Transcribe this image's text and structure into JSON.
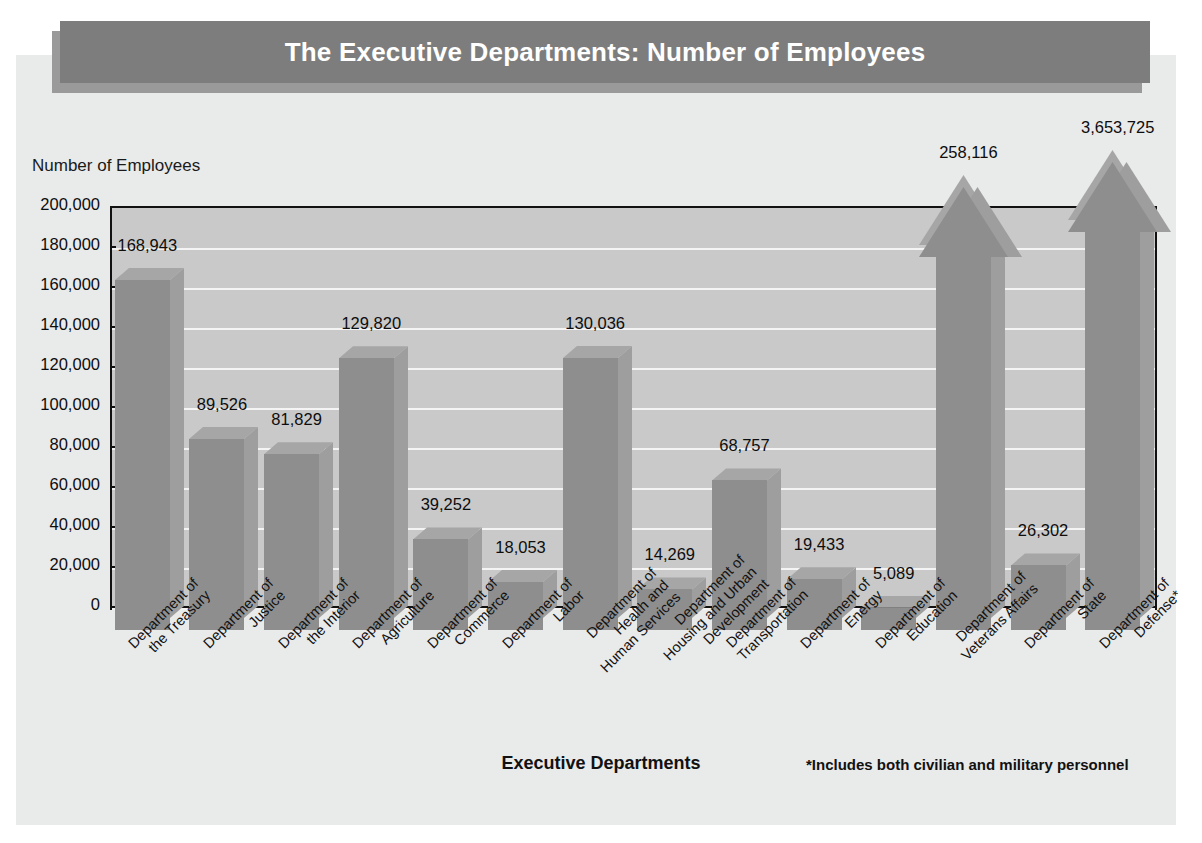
{
  "title": "The Executive Departments: Number of Employees",
  "axis": {
    "y_title": "Number of Employees",
    "x_title": "Executive Departments",
    "footnote": "*Includes both civilian and military personnel"
  },
  "chart_data": {
    "type": "bar",
    "title": "The Executive Departments: Number of Employees",
    "xlabel": "Executive Departments",
    "ylabel": "Number of Employees",
    "ylim": [
      0,
      200000
    ],
    "ytick_labels": [
      "200,000",
      "180,000",
      "160,000",
      "140,000",
      "120,000",
      "100,000",
      "80,000",
      "60,000",
      "40,000",
      "20,000",
      "0"
    ],
    "ytick_values": [
      200000,
      180000,
      160000,
      140000,
      120000,
      100000,
      80000,
      60000,
      40000,
      20000,
      0
    ],
    "grid": true,
    "legend": "none",
    "annotation": "*Includes both civilian and military personnel",
    "categories": [
      "Department of the Treasury",
      "Department of Justice",
      "Department of the Interior",
      "Department of Agriculture",
      "Department of Commerce",
      "Department of Labor",
      "Department of Health and Human Services",
      "Department of Housing and Urban Development",
      "Department of Transportation",
      "Department of Energy",
      "Department of Education",
      "Department of Veterans Affairs",
      "Department of State",
      "Department of Defense*"
    ],
    "values": [
      168943,
      89526,
      81829,
      129820,
      39252,
      18053,
      130036,
      14269,
      68757,
      19433,
      5089,
      258116,
      26302,
      3653725
    ],
    "value_labels": [
      "168,943",
      "89,526",
      "81,829",
      "129,820",
      "39,252",
      "18,053",
      "130,036",
      "14,269",
      "68,757",
      "19,433",
      "5,089",
      "258,116",
      "26,302",
      "3,653,725"
    ],
    "overflow_bars": [
      "Department of Veterans Affairs",
      "Department of Defense*"
    ]
  },
  "categories_wrapped": [
    [
      "Department of",
      "the Treasury"
    ],
    [
      "Department of",
      "Justice"
    ],
    [
      "Department of",
      "the Interior"
    ],
    [
      "Department of",
      "Agriculture"
    ],
    [
      "Department of",
      "Commerce"
    ],
    [
      "Department of",
      "Labor"
    ],
    [
      "Department of",
      "Health and",
      "Human Services"
    ],
    [
      "Department of",
      "Housing and Urban",
      "Development"
    ],
    [
      "Department of",
      "Transportation"
    ],
    [
      "Department of",
      "Energy"
    ],
    [
      "Department of",
      "Education"
    ],
    [
      "Department of",
      "Veterans Affairs"
    ],
    [
      "Department of",
      "State"
    ],
    [
      "Department of",
      "Defense*"
    ]
  ],
  "colors": {
    "title_bar": "#7d7d7d",
    "title_shadow": "#9a9a9a",
    "page_panel": "#e9eaea",
    "plot_background": "#c9c9c9",
    "gridline": "#f4f4f4",
    "bar_front": "#8e8e8e",
    "bar_side": "#9e9e9e",
    "bar_top": "#a6a6a6",
    "axis": "#111111",
    "text": "#0d0d0d",
    "title_text": "#ffffff"
  }
}
